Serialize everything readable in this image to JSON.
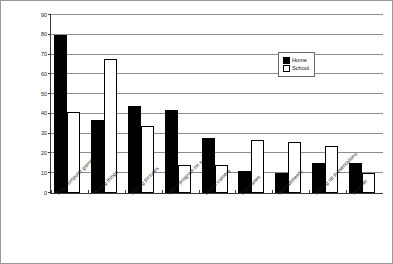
{
  "chart_data": {
    "type": "bar",
    "title": "",
    "subtitle": "",
    "xlabel": "",
    "ylabel": "",
    "ylim": [
      0,
      90
    ],
    "ytick_step": 10,
    "yticks": [
      0,
      10,
      20,
      30,
      40,
      50,
      60,
      70,
      80,
      90
    ],
    "grid": true,
    "legend_position": "top-right",
    "categories": [
      "Play computer games",
      "Writing things",
      "Making pictures",
      "Use a program on a CD",
      "Digital camera",
      "Databases",
      "Spreadsheets",
      "Making up presentations",
      "Scanner"
    ],
    "series": [
      {
        "name": "Home",
        "color": "#000000",
        "swatch": "filled",
        "values": [
          80,
          37,
          44,
          42,
          28,
          11,
          10,
          15,
          15
        ]
      },
      {
        "name": "School",
        "color": "#ffffff",
        "swatch": "open",
        "values": [
          41,
          68,
          34,
          14,
          14,
          27,
          26,
          24,
          10
        ]
      }
    ]
  },
  "legend": {
    "items": [
      {
        "label": "Home",
        "swatch": "filled"
      },
      {
        "label": "School",
        "swatch": "open"
      }
    ]
  },
  "colors": {
    "home": "#000000",
    "school": "#ffffff",
    "axis": "#3a3a3a",
    "gridline": "#8c8c8c",
    "frame": "#9a9a9a",
    "text": "#1a1a1a"
  }
}
